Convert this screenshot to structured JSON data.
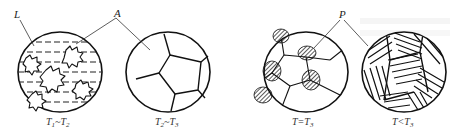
{
  "figure": {
    "type": "microstructure-evolution-diagram",
    "panels": [
      {
        "caption_main": "T",
        "caption_sub1": "1",
        "caption_dash": "~T",
        "caption_sub2": "2",
        "pointer_label": "L",
        "description": "liquid with austenite dendrites"
      },
      {
        "caption_main": "T",
        "caption_sub1": "2",
        "caption_dash": "~T",
        "caption_sub2": "3",
        "description": "polygonal austenite grains"
      },
      {
        "caption_main": "T=T",
        "caption_sub2": "3",
        "pointer_label": "P",
        "description": "pearlite nucleating at grain boundaries"
      },
      {
        "caption_main": "T<T",
        "caption_sub2": "3",
        "description": "full lamellar pearlite"
      }
    ],
    "pointer_labels": {
      "L": "L",
      "A": "A",
      "P": "P"
    }
  }
}
